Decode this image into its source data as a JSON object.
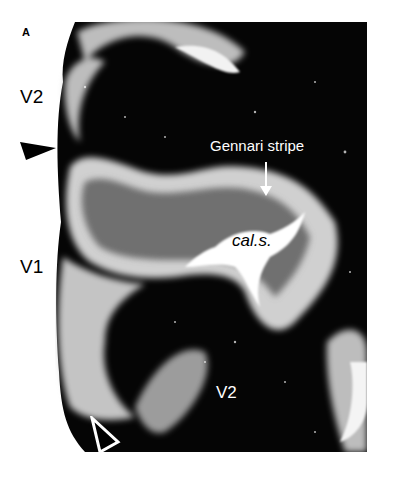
{
  "figure": {
    "panel_label": "A",
    "labels": {
      "v2_top": "V2",
      "v1": "V1",
      "v2_bottom": "V2",
      "gennari": "Gennari stripe",
      "calcarine": "cal.s."
    },
    "colors": {
      "background": "#ffffff",
      "tissue_dark": "#050505",
      "cortex_light": "#d8d8d8",
      "text_dark": "#000000",
      "text_light": "#ffffff"
    }
  }
}
